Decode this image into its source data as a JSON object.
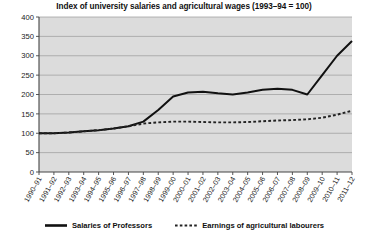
{
  "chart_data": {
    "type": "line",
    "title": "Index of university salaries and agricultural wages (1993–94 = 100)",
    "xlabel": "",
    "ylabel": "",
    "ylim": [
      0,
      400
    ],
    "ytick_labels": [
      "0",
      "50",
      "100",
      "150",
      "200",
      "250",
      "300",
      "350",
      "400"
    ],
    "yticks": [
      0,
      50,
      100,
      150,
      200,
      250,
      300,
      350,
      400
    ],
    "grid": true,
    "legend_position": "bottom",
    "categories": [
      "1990–91",
      "1991–92",
      "1992–93",
      "1993–94",
      "1994–95",
      "1995–96",
      "1996–97",
      "1997–98",
      "1998–99",
      "1999–00",
      "2000–01",
      "2001–02",
      "2002–03",
      "2003–04",
      "2004–05",
      "2005–06",
      "2006–07",
      "2007–08",
      "2008–09",
      "2009–10",
      "2010–11",
      "2011–12"
    ],
    "series": [
      {
        "name": "Salaries of Professors",
        "style": "solid",
        "color": "#111111",
        "values": [
          100,
          100,
          102,
          105,
          108,
          112,
          118,
          130,
          160,
          195,
          205,
          207,
          203,
          200,
          205,
          212,
          215,
          212,
          200,
          250,
          300,
          338
        ]
      },
      {
        "name": "Earnings of agricultural labourers",
        "style": "dashed",
        "color": "#222222",
        "values": [
          100,
          100,
          102,
          105,
          108,
          112,
          118,
          125,
          128,
          130,
          130,
          129,
          128,
          128,
          129,
          131,
          133,
          134,
          136,
          140,
          148,
          158
        ]
      }
    ]
  },
  "legend": {
    "entries": [
      {
        "label": "Salaries of Professors",
        "style": "solid"
      },
      {
        "label": "Earnings of agricultural labourers",
        "style": "dashed"
      }
    ]
  },
  "colors": {
    "plot_background": "#dcdcdc",
    "gridline": "#9a9a9a",
    "axis": "#444444",
    "page_background": "#ffffff",
    "text": "#101010"
  }
}
